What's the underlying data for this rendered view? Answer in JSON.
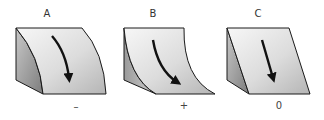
{
  "figure": {
    "panels": [
      {
        "label": "A",
        "sign": "–",
        "surface": "convex"
      },
      {
        "label": "B",
        "sign": "+",
        "surface": "concave"
      },
      {
        "label": "C",
        "sign": "0",
        "surface": "planar"
      }
    ]
  },
  "colors": {
    "outline": "#1a1a1a",
    "face_light": "#f2f2f2",
    "face_mid": "#bdbdbd",
    "side_dark": "#8c8c8c",
    "arrow": "#111111",
    "text": "#333333"
  }
}
